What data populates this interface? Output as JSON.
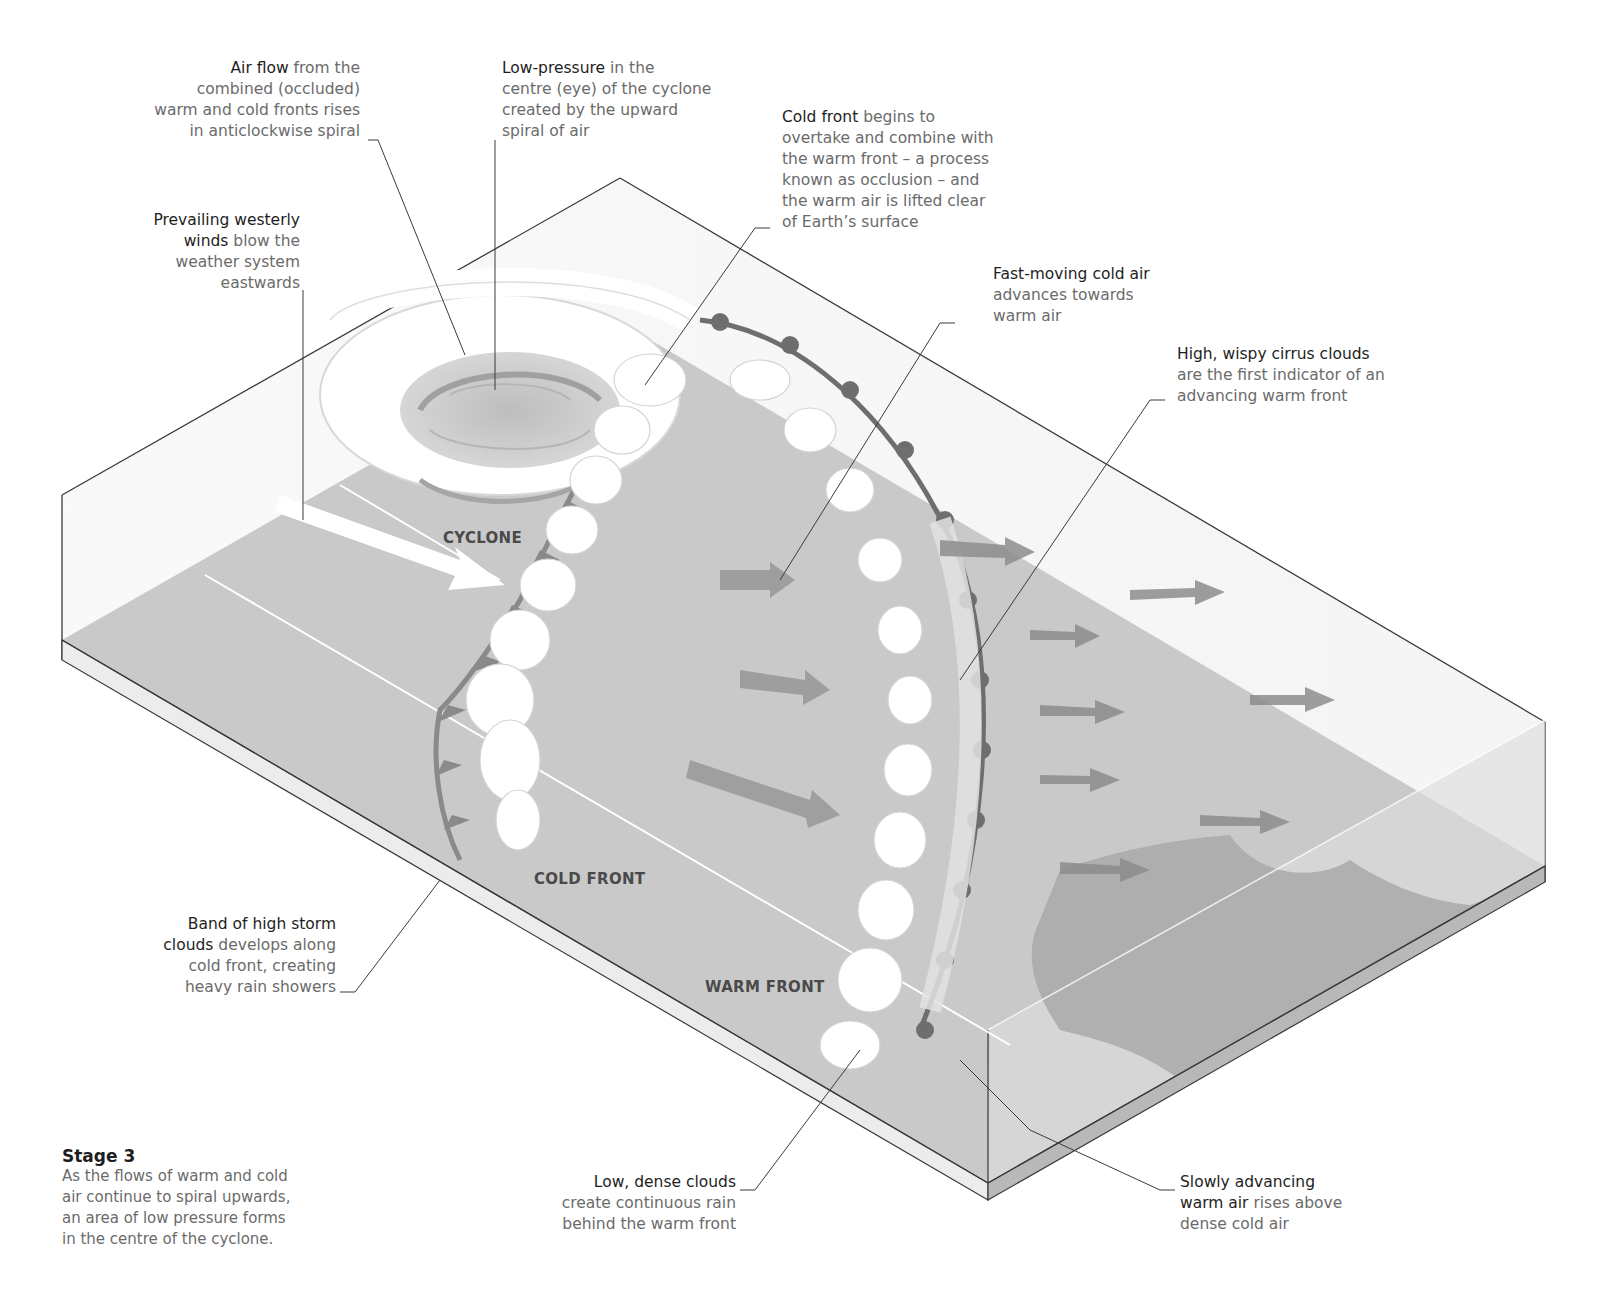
{
  "annotations": {
    "air_flow": {
      "bold": "Air flow",
      "text_lines": [
        " from the",
        "combined (occluded)",
        "warm and cold fronts rises",
        "in anticlockwise spiral"
      ]
    },
    "low_pressure": {
      "bold": "Low-pressure",
      "text_lines": [
        " in the",
        "centre (eye) of the cyclone",
        "created by the upward",
        "spiral of air"
      ]
    },
    "cold_front_occlusion": {
      "bold": "Cold front",
      "text_lines": [
        " begins to",
        "overtake and combine with",
        "the warm front – a process",
        "known as occlusion – and",
        "the warm air is lifted clear",
        "of Earth’s surface"
      ]
    },
    "prevailing_winds": {
      "bold_lines": [
        "Prevailing westerly",
        "winds"
      ],
      "text_lines": [
        " blow the",
        "weather system",
        "eastwards"
      ]
    },
    "fast_cold_air": {
      "bold": "Fast-moving cold air",
      "text_lines": [
        "advances towards",
        "warm air"
      ]
    },
    "cirrus": {
      "bold": "High, wispy cirrus clouds",
      "text_lines": [
        "are the first indicator of an",
        "advancing warm front"
      ]
    },
    "storm_clouds": {
      "bold_lines": [
        "Band of high storm",
        "clouds"
      ],
      "text_lines": [
        " develops along",
        "cold front, creating",
        "heavy rain showers"
      ]
    },
    "low_dense_clouds": {
      "bold": "Low, dense clouds",
      "text_lines": [
        "create continuous rain",
        "behind the warm front"
      ]
    },
    "slow_warm_air": {
      "bold_lines": [
        "Slowly advancing",
        "warm air"
      ],
      "text_lines": [
        " rises above",
        "dense cold air"
      ]
    }
  },
  "map_labels": {
    "cyclone": "CYCLONE",
    "cold_front": "COLD FRONT",
    "warm_front": "WARM FRONT"
  },
  "stage": {
    "title": "Stage 3",
    "lines": [
      "As the flows of warm and cold",
      "air continue to spiral upwards,",
      "an area of low pressure forms",
      "in the centre of the cyclone."
    ]
  },
  "colors": {
    "ground": "#c9c9c9",
    "ground_dark": "#b4b4b4",
    "box_edge": "#3a3a3a",
    "cloud": "#ffffff",
    "front_line": "#7a7a7a",
    "arrow_grey": "#8d8d8d",
    "land": "#a9a9a9"
  }
}
